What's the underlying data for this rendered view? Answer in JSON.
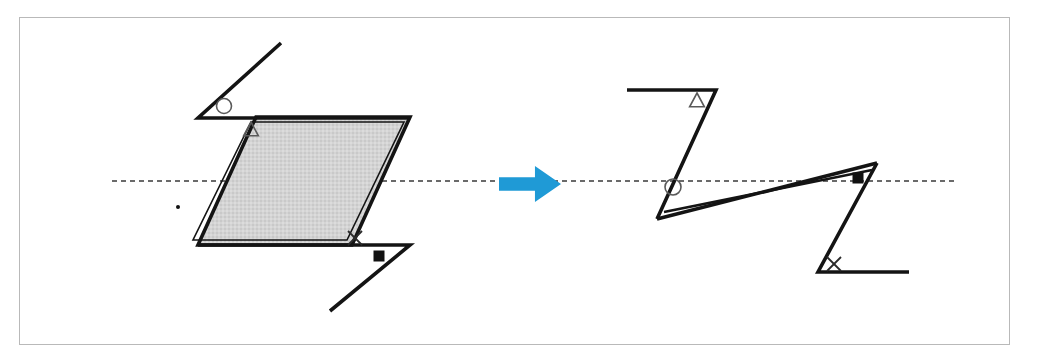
{
  "figure": {
    "background_color": "#ffffff",
    "frame_color": "#b9b9b9",
    "ink_color": "#141414",
    "fill_color": "#d2d2d2",
    "arrow_color": "#1f9ad6",
    "axis_color": "#3a3a3a",
    "canvas": {
      "width": 1056,
      "height": 362
    },
    "frame": {
      "x": 19,
      "y": 17,
      "width": 991,
      "height": 328
    }
  },
  "axis": {
    "label": "horizontal-reference-dashed-line",
    "y": 181,
    "x_start": 112,
    "x_end": 956,
    "dash_pattern": "5 4"
  },
  "arrow": {
    "label": "transformation-arrow",
    "direction": "right",
    "color": "#1f9ad6",
    "x": 499,
    "y": 166,
    "width": 62,
    "height": 36
  },
  "left_figure": {
    "label": "source-shape",
    "description": "Filled parallelogram with two straight-line arms forming a rotationally symmetric Z",
    "parallelogram": {
      "label": "shaded-parallelogram",
      "fill": "#d2d2d2",
      "points": [
        [
          256,
          117
        ],
        [
          410,
          117
        ],
        [
          352,
          245
        ],
        [
          198,
          245
        ]
      ]
    },
    "parallelogram_inner_outline": {
      "label": "parallelogram-inner-edge",
      "points": [
        [
          251,
          122
        ],
        [
          404,
          122
        ],
        [
          347,
          240
        ],
        [
          193,
          240
        ]
      ]
    },
    "arm_top": {
      "label": "upper-left-arm",
      "points": [
        [
          281,
          43
        ],
        [
          198,
          118
        ],
        [
          410,
          118
        ]
      ]
    },
    "arm_bottom": {
      "label": "lower-right-arm",
      "points": [
        [
          330,
          311
        ],
        [
          410,
          245
        ],
        [
          198,
          245
        ]
      ]
    },
    "markers": [
      {
        "label": "circle-marker",
        "glyph": "circle",
        "x": 224,
        "y": 106,
        "size": 7.5,
        "style": "open"
      },
      {
        "label": "triangle-marker",
        "glyph": "triangle",
        "x": 251,
        "y": 130,
        "size": 8,
        "style": "open"
      },
      {
        "label": "x-marker",
        "glyph": "x",
        "x": 355,
        "y": 238,
        "size": 7,
        "style": "open"
      },
      {
        "label": "square-marker",
        "glyph": "square",
        "x": 379,
        "y": 256,
        "size": 11,
        "style": "solid"
      },
      {
        "label": "stray-dot",
        "glyph": "dot",
        "x": 178,
        "y": 207,
        "size": 2,
        "style": "solid"
      }
    ]
  },
  "right_figure": {
    "label": "result-shape",
    "description": "Degenerate sheared figure: two Z-shaped arms joined by a collapsed thin sliver",
    "arm_top": {
      "label": "upper-z-arm",
      "points": [
        [
          627,
          90
        ],
        [
          716,
          90
        ],
        [
          657,
          219
        ]
      ]
    },
    "arm_bottom": {
      "label": "lower-z-arm",
      "points": [
        [
          877,
          163
        ],
        [
          818,
          272
        ],
        [
          909,
          272
        ]
      ]
    },
    "sliver_upper": {
      "label": "collapsed-sliver-upper-edge",
      "points": [
        [
          657,
          219
        ],
        [
          877,
          163
        ]
      ]
    },
    "sliver_lower": {
      "label": "collapsed-sliver-lower-edge",
      "points": [
        [
          664,
          212
        ],
        [
          872,
          170
        ]
      ]
    },
    "markers": [
      {
        "label": "triangle-marker",
        "glyph": "triangle",
        "x": 697,
        "y": 101,
        "size": 8,
        "style": "open"
      },
      {
        "label": "circle-marker",
        "glyph": "circle",
        "x": 673,
        "y": 187,
        "size": 8,
        "style": "open"
      },
      {
        "label": "square-marker",
        "glyph": "square",
        "x": 858,
        "y": 178,
        "size": 11,
        "style": "solid"
      },
      {
        "label": "x-marker",
        "glyph": "x",
        "x": 834,
        "y": 264,
        "size": 7,
        "style": "open"
      }
    ]
  }
}
